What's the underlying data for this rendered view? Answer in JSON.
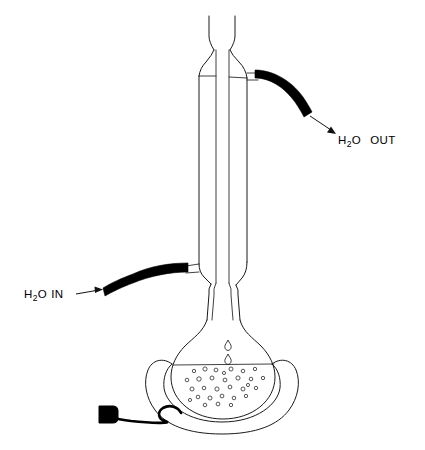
{
  "figure": {
    "title": "Reflux apparatus with condenser, round-bottom flask and heating mantle",
    "background_color": "#ffffff",
    "line_color": "#1a1a1a",
    "hose_color": "#000000",
    "width": 425,
    "height": 450
  },
  "labels": {
    "water_out": {
      "prefix": "H",
      "subscript": "2",
      "suffix": "O",
      "word": "OUT",
      "full_text": "H2O  OUT",
      "x": 338,
      "y": 144
    },
    "water_in": {
      "prefix": "H",
      "subscript": "2",
      "suffix": "O",
      "word": "IN",
      "full_text": "H2O IN",
      "x": 24,
      "y": 298
    }
  },
  "components": [
    {
      "name": "condenser-top-opening",
      "label": "Condenser top opening"
    },
    {
      "name": "condenser-jacket",
      "label": "Water-jacketed condenser"
    },
    {
      "name": "condenser-inner-tube",
      "label": "Inner vapour tube"
    },
    {
      "name": "water-outlet-port",
      "label": "Upper water outlet port"
    },
    {
      "name": "water-inlet-port",
      "label": "Lower water inlet port"
    },
    {
      "name": "outlet-hose",
      "label": "Black rubber outlet hose"
    },
    {
      "name": "inlet-hose",
      "label": "Black rubber inlet hose"
    },
    {
      "name": "ground-glass-joint",
      "label": "Ground glass joint"
    },
    {
      "name": "round-bottom-flask",
      "label": "Round bottom flask"
    },
    {
      "name": "boiling-liquid",
      "label": "Boiling liquid with bubbles"
    },
    {
      "name": "condensate-drops",
      "label": "Falling condensate drops"
    },
    {
      "name": "heating-mantle",
      "label": "Heating mantle"
    },
    {
      "name": "power-cord",
      "label": "Power cord"
    },
    {
      "name": "power-plug",
      "label": "Power plug"
    }
  ],
  "bubbles": [
    {
      "cx": 194,
      "cy": 371,
      "r": 1.7
    },
    {
      "cx": 205,
      "cy": 369,
      "r": 2.1
    },
    {
      "cx": 216,
      "cy": 370,
      "r": 1.9
    },
    {
      "cx": 231,
      "cy": 369,
      "r": 2.0
    },
    {
      "cx": 243,
      "cy": 371,
      "r": 1.8
    },
    {
      "cx": 255,
      "cy": 369,
      "r": 1.7
    },
    {
      "cx": 187,
      "cy": 380,
      "r": 1.8
    },
    {
      "cx": 199,
      "cy": 379,
      "r": 2.2
    },
    {
      "cx": 212,
      "cy": 378,
      "r": 2.0
    },
    {
      "cx": 225,
      "cy": 380,
      "r": 1.9
    },
    {
      "cx": 238,
      "cy": 378,
      "r": 2.1
    },
    {
      "cx": 251,
      "cy": 379,
      "r": 1.8
    },
    {
      "cx": 263,
      "cy": 378,
      "r": 1.7
    },
    {
      "cx": 192,
      "cy": 389,
      "r": 2.0
    },
    {
      "cx": 204,
      "cy": 388,
      "r": 1.8
    },
    {
      "cx": 217,
      "cy": 389,
      "r": 2.1
    },
    {
      "cx": 230,
      "cy": 387,
      "r": 1.9
    },
    {
      "cx": 243,
      "cy": 389,
      "r": 2.0
    },
    {
      "cx": 256,
      "cy": 388,
      "r": 1.7
    },
    {
      "cx": 198,
      "cy": 397,
      "r": 1.8
    },
    {
      "cx": 210,
      "cy": 398,
      "r": 2.0
    },
    {
      "cx": 222,
      "cy": 396,
      "r": 1.9
    },
    {
      "cx": 234,
      "cy": 398,
      "r": 1.8
    },
    {
      "cx": 246,
      "cy": 396,
      "r": 1.7
    },
    {
      "cx": 205,
      "cy": 405,
      "r": 1.8
    },
    {
      "cx": 218,
      "cy": 404,
      "r": 1.9
    },
    {
      "cx": 231,
      "cy": 405,
      "r": 1.7
    },
    {
      "cx": 190,
      "cy": 400,
      "r": 1.6
    },
    {
      "cx": 224,
      "cy": 373,
      "r": 1.6
    },
    {
      "cx": 248,
      "cy": 385,
      "r": 1.6
    }
  ],
  "drops": [
    {
      "cx": 228,
      "cy": 345,
      "label": "condensate-drop-upper"
    },
    {
      "cx": 228,
      "cy": 359,
      "label": "condensate-drop-lower"
    }
  ]
}
